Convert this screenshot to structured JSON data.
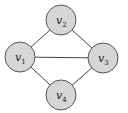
{
  "diagram": {
    "type": "undirected-graph",
    "colors": {
      "node_fill": "#d6d6d6",
      "node_stroke": "#555555",
      "edge": "#444444",
      "label": "#222222",
      "background": "#ffffff"
    },
    "nodes": [
      {
        "id": "v1",
        "base": "v",
        "sub": "1"
      },
      {
        "id": "v2",
        "base": "v",
        "sub": "2"
      },
      {
        "id": "v3",
        "base": "v",
        "sub": "3"
      },
      {
        "id": "v4",
        "base": "v",
        "sub": "4"
      }
    ],
    "edges": [
      {
        "from": "v1",
        "to": "v2"
      },
      {
        "from": "v2",
        "to": "v3"
      },
      {
        "from": "v1",
        "to": "v3"
      },
      {
        "from": "v1",
        "to": "v4"
      },
      {
        "from": "v4",
        "to": "v3"
      }
    ]
  }
}
